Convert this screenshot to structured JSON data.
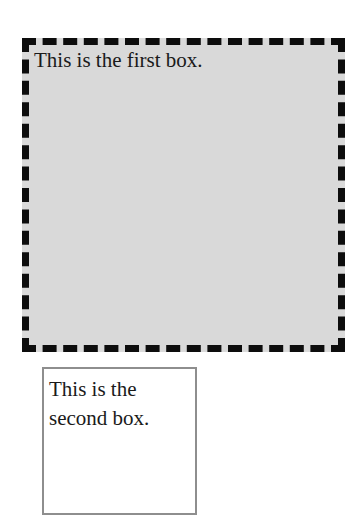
{
  "first_box": {
    "text": "This is the first box.",
    "border_style": "dashed"
  },
  "second_box": {
    "text": "This is the second box.",
    "border_style": "solid"
  },
  "colors": {
    "page_bg": "#ffffff",
    "text": "#1a1a1a",
    "first_box_bg": "#d9d9d9",
    "first_box_border": "#0d0d0d",
    "second_box_bg": "#ffffff",
    "second_box_border": "#8e8e8e"
  }
}
